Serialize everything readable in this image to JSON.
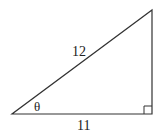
{
  "diagram": {
    "type": "right-triangle",
    "hypotenuse_label": "12",
    "adjacent_label": "11",
    "angle_label": "θ",
    "line_color": "#333333",
    "right_angle_at": "bottom-right"
  }
}
